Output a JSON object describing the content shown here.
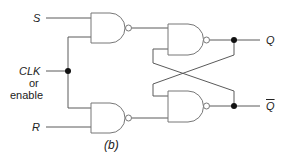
{
  "diagram": {
    "caption": "(b)",
    "inputs": {
      "s": "S",
      "clk": "CLK",
      "clk_or": "or",
      "clk_enable": "enable",
      "r": "R"
    },
    "outputs": {
      "q": "Q",
      "q_bar": "Q"
    },
    "gates": [
      {
        "id": "nand-s",
        "type": "NAND",
        "inputs": [
          "S",
          "CLK"
        ]
      },
      {
        "id": "nand-r",
        "type": "NAND",
        "inputs": [
          "CLK",
          "R"
        ]
      },
      {
        "id": "nand-q",
        "type": "NAND",
        "inputs": [
          "nand-s",
          "Q_bar feedback"
        ],
        "output": "Q"
      },
      {
        "id": "nand-qbar",
        "type": "NAND",
        "inputs": [
          "Q feedback",
          "nand-r"
        ],
        "output": "Q_bar"
      }
    ],
    "colors": {
      "line": "#555555",
      "gate_stroke": "#777777",
      "dot": "#111111",
      "text": "#222222"
    }
  }
}
